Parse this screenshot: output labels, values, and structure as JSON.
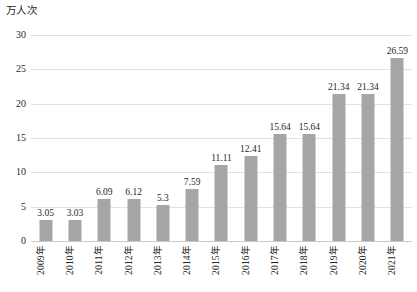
{
  "chart_data": {
    "type": "bar",
    "title": "",
    "subtitle": "",
    "xlabel": "",
    "ylabel": "万人次",
    "ylim": [
      0,
      30
    ],
    "ytick_labels": [
      "30",
      "25",
      "20",
      "15",
      "10",
      "5",
      "0"
    ],
    "ytick_values": [
      30,
      25,
      20,
      15,
      10,
      5,
      0
    ],
    "grid": true,
    "legend": false,
    "legend_position": "none",
    "bar_color": "#a6a6a6",
    "categories": [
      "2009年",
      "2010年",
      "2011年",
      "2012年",
      "2013年",
      "2014年",
      "2015年",
      "2016年",
      "2017年",
      "2018年",
      "2019年",
      "2020年",
      "2021年"
    ],
    "values": [
      3.05,
      3.03,
      6.09,
      6.12,
      5.3,
      7.59,
      11.11,
      12.41,
      15.64,
      15.64,
      21.34,
      21.34,
      26.59
    ],
    "data_labels": [
      "3.05",
      "3.03",
      "6.09",
      "6.12",
      "5.3",
      "7.59",
      "11.11",
      "12.41",
      "15.64",
      "15.64",
      "21.34",
      "21.34",
      "26.59"
    ],
    "series": [
      {
        "name": "",
        "values": [
          3.05,
          3.03,
          6.09,
          6.12,
          5.3,
          7.59,
          11.11,
          12.41,
          15.64,
          15.64,
          21.34,
          21.34,
          26.59
        ]
      }
    ]
  }
}
